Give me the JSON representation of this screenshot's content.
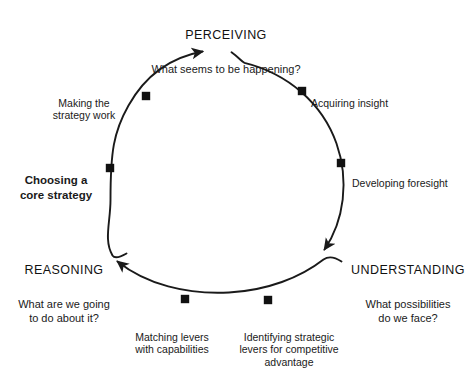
{
  "diagram": {
    "type": "cycle",
    "stroke_color": "#1a1a1a",
    "background_color": "#ffffff",
    "marker_color": "#111111",
    "phases": [
      {
        "id": "perceiving",
        "heading": "PERCEIVING",
        "question": "What seems to be happening?",
        "position": "top"
      },
      {
        "id": "understanding",
        "heading": "UNDERSTANDING",
        "question": "What possibilities\ndo we face?",
        "position": "lower-right"
      },
      {
        "id": "reasoning",
        "heading": "REASONING",
        "question": "What are we going\nto do about it?",
        "position": "lower-left"
      }
    ],
    "nodes": [
      {
        "id": "acquiring-insight",
        "label": "Acquiring insight",
        "bold": false,
        "marker": {
          "x": 302,
          "y": 91
        }
      },
      {
        "id": "developing-foresight",
        "label": "Developing foresight",
        "bold": false,
        "marker": {
          "x": 341,
          "y": 163
        }
      },
      {
        "id": "identifying-levers",
        "label": "Identifying strategic\nlevers for competitive\nadvantage",
        "bold": false,
        "marker": {
          "x": 268,
          "y": 300
        }
      },
      {
        "id": "matching-levers",
        "label": "Matching levers\nwith capabilities",
        "bold": false,
        "marker": {
          "x": 185,
          "y": 299
        }
      },
      {
        "id": "choosing-core-strategy",
        "label": "Choosing a\ncore strategy",
        "bold": true,
        "marker": {
          "x": 110,
          "y": 168
        }
      },
      {
        "id": "making-strategy-work",
        "label": "Making the\nstrategy work",
        "bold": false,
        "marker": {
          "x": 146,
          "y": 96
        }
      }
    ],
    "geometry": {
      "center_x": 226,
      "center_y": 168,
      "radius": 116,
      "direction": "clockwise"
    }
  }
}
